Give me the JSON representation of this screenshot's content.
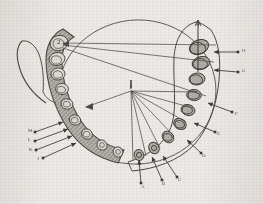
{
  "figure": {
    "media": "scanned-grayscale-line-drawing",
    "background_color": "#eceae6",
    "ink_color": "#4a4843",
    "width": 263,
    "height": 204
  },
  "markers": [
    {
      "id": "marker-1",
      "label": "1",
      "x": 131,
      "y": 88,
      "role": "central-fan-origin"
    },
    {
      "id": "marker-2",
      "label": "2",
      "x": 59,
      "y": 43,
      "role": "left-posterior-point"
    },
    {
      "id": "marker-4",
      "label": "4",
      "x": 198,
      "y": 25,
      "role": "right-posterior-axis-point"
    }
  ],
  "callouts": {
    "right": [
      {
        "id": "callout-h",
        "label": "H",
        "lx": 243,
        "ly": 51,
        "tail_x": 238,
        "tail_y": 52,
        "head_x": 214,
        "head_y": 52
      },
      {
        "id": "callout-g",
        "label": "G",
        "lx": 243,
        "ly": 71,
        "tail_x": 238,
        "tail_y": 72,
        "head_x": 214,
        "head_y": 70
      },
      {
        "id": "callout-f",
        "label": "F",
        "lx": 236,
        "ly": 114,
        "tail_x": 232,
        "tail_y": 112,
        "head_x": 208,
        "head_y": 103
      },
      {
        "id": "callout-e",
        "label": "E",
        "lx": 218,
        "ly": 134,
        "tail_x": 215,
        "tail_y": 132,
        "head_x": 194,
        "head_y": 123
      },
      {
        "id": "callout-d",
        "label": "D",
        "lx": 203,
        "ly": 156,
        "tail_x": 201,
        "tail_y": 153,
        "head_x": 187,
        "head_y": 140
      }
    ],
    "bottom": [
      {
        "id": "callout-c",
        "label": "C",
        "lx": 179,
        "ly": 180,
        "tail_x": 177,
        "tail_y": 177,
        "head_x": 163,
        "head_y": 156
      },
      {
        "id": "callout-b",
        "label": "B",
        "lx": 163,
        "ly": 184,
        "tail_x": 162,
        "tail_y": 180,
        "head_x": 152,
        "head_y": 157
      },
      {
        "id": "callout-a",
        "label": "A",
        "lx": 142,
        "ly": 187,
        "tail_x": 141,
        "tail_y": 183,
        "head_x": 139,
        "head_y": 160
      }
    ],
    "left": [
      {
        "id": "callout-m",
        "label": "M",
        "lx": 29,
        "ly": 131,
        "tail_x": 35,
        "tail_y": 132,
        "head_x": 63,
        "head_y": 122
      },
      {
        "id": "callout-l",
        "label": "L",
        "lx": 29,
        "ly": 140,
        "tail_x": 35,
        "tail_y": 141,
        "head_x": 68,
        "head_y": 129
      },
      {
        "id": "callout-k",
        "label": "K",
        "lx": 30,
        "ly": 150,
        "tail_x": 36,
        "tail_y": 150,
        "head_x": 72,
        "head_y": 136
      },
      {
        "id": "callout-j",
        "label": "J",
        "lx": 38,
        "ly": 159,
        "tail_x": 43,
        "tail_y": 158,
        "head_x": 76,
        "head_y": 143
      }
    ]
  },
  "structures": {
    "shaded_arch_side": "left",
    "outlined_arch_side": "right",
    "overlay_shape": "large-ellipse",
    "fan_lines_from_marker_1": 8,
    "long_lines_from_left_molar": 3,
    "hook_curve": "lower-left-ramus-outline",
    "teeth_left_count": 8,
    "teeth_right_count": 8
  }
}
